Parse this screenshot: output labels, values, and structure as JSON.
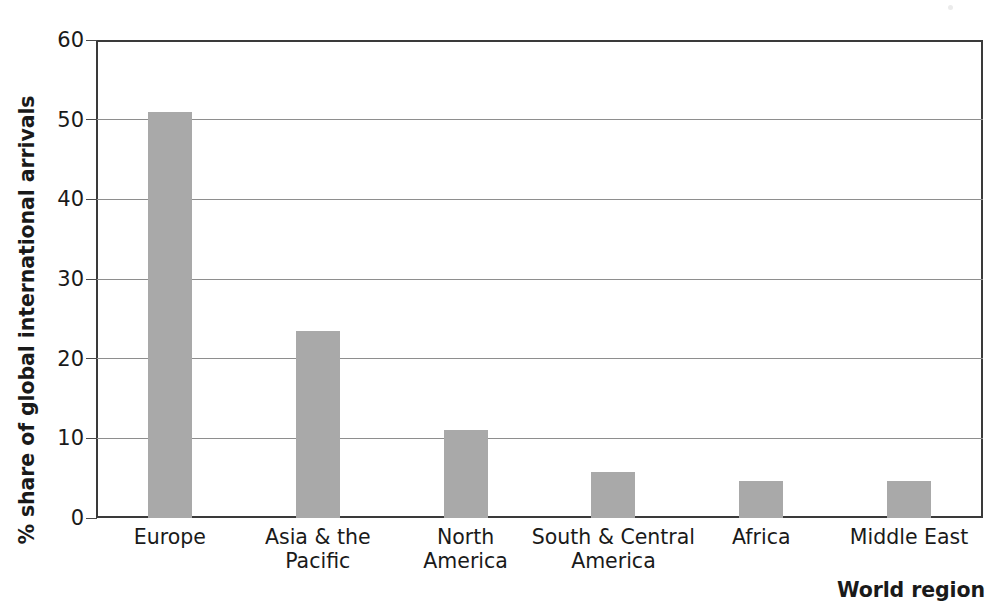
{
  "chart_data": {
    "type": "bar",
    "title": "",
    "subtitle": "",
    "xlabel": "World region",
    "ylabel": "% share of global international arrivals",
    "categories": [
      "Europe",
      "Asia & the\nPacific",
      "North\nAmerica",
      "South & Central\nAmerica",
      "Africa",
      "Middle East"
    ],
    "values": [
      51.0,
      23.5,
      11.1,
      5.8,
      4.7,
      4.7
    ],
    "ylim": [
      0,
      60
    ],
    "yticks": [
      0,
      10,
      20,
      30,
      40,
      50,
      60
    ],
    "ytick_labels": [
      "0",
      "10",
      "20",
      "30",
      "40",
      "50",
      "60"
    ],
    "grid": "horizontal",
    "legend": "none",
    "bar_color": "#a9a9a9",
    "axis_color": "#3a3a3a",
    "gridline_color": "#8e8e8e"
  },
  "figure": {
    "y_axis_title": "% share of global international arrivals",
    "x_axis_title": "World region"
  }
}
